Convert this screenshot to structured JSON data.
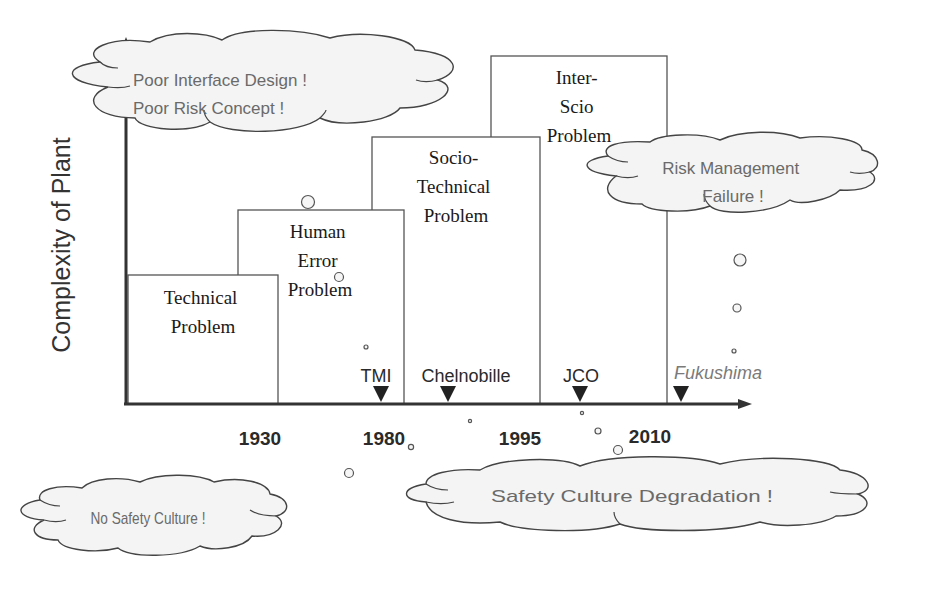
{
  "axes": {
    "y_label": "Complexity of Plant",
    "x_ticks": [
      "1930",
      "1980",
      "1995",
      "2010"
    ]
  },
  "eras": [
    {
      "lines": [
        "Technical",
        "Problem"
      ]
    },
    {
      "lines": [
        "Human",
        "Error",
        "Problem"
      ]
    },
    {
      "lines": [
        "Socio-",
        "Technical",
        "Problem"
      ]
    },
    {
      "lines": [
        "Inter-",
        "Scio",
        "Problem"
      ]
    }
  ],
  "events": [
    {
      "label": "TMI"
    },
    {
      "label": "Chelnobille"
    },
    {
      "label": "JCO"
    },
    {
      "label": "Fukushima"
    }
  ],
  "clouds": {
    "top_left": {
      "lines": [
        "Poor Interface Design !",
        "Poor Risk Concept !"
      ]
    },
    "right": {
      "lines": [
        "Risk Management",
        "Failure !"
      ]
    },
    "bottom_left": {
      "lines": [
        "No Safety Culture !"
      ]
    },
    "bottom_right": {
      "lines": [
        "Safety Culture Degradation !"
      ]
    }
  },
  "colors": {
    "cloud_fill": "#f4f4f4",
    "cloud_text": "#6a6a6a",
    "box_stroke": "#555555",
    "axis": "#333333",
    "marker": "#222222"
  }
}
